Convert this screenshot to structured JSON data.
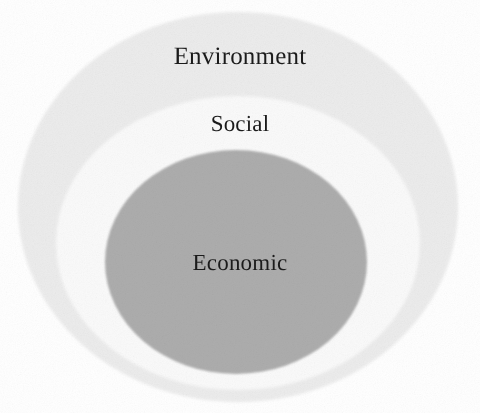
{
  "figure": {
    "background_color": "#ffffff"
  },
  "rings": [
    {
      "id": "environment",
      "label": "Environment",
      "level": 1,
      "role": "outermost ring",
      "fill_color": "#ececec",
      "edge_color": "#e2e2e2",
      "center_x": 238,
      "center_y": 207,
      "radius_x": 220,
      "radius_y": 195,
      "label_x": 238,
      "label_y": 58,
      "label_font_size": 25
    },
    {
      "id": "social",
      "label": "Social",
      "level": 2,
      "role": "middle ring",
      "fill_color": "#fafafa",
      "edge_color": "#f1f1f1",
      "center_x": 238,
      "center_y": 243,
      "radius_x": 182,
      "radius_y": 147,
      "label_x": 238,
      "label_y": 125,
      "label_font_size": 23
    },
    {
      "id": "economic",
      "label": "Economic",
      "level": 3,
      "role": "innermost ring",
      "fill_color": "#adadad",
      "edge_color": "#a6a6a6",
      "center_x": 236,
      "center_y": 262,
      "radius_x": 131,
      "radius_y": 112,
      "label_x": 236,
      "label_y": 264,
      "label_font_size": 23
    }
  ],
  "label_color": "#1b1b1b"
}
